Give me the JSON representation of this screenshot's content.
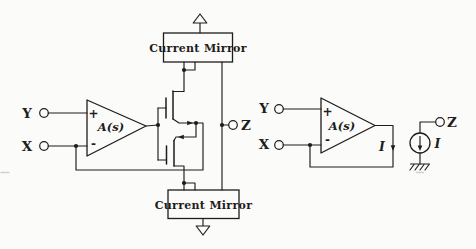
{
  "figure": {
    "colors": {
      "ink": "#1f1d1b",
      "paper": "#fbfbf9"
    },
    "left_circuit": {
      "terminal_y": "Y",
      "terminal_x": "X",
      "terminal_z": "Z",
      "opamp_gain_label": "A(s)",
      "opamp_plus": "+",
      "opamp_minus": "-",
      "top_current_mirror_label": "Current Mirror",
      "bottom_current_mirror_label": "Current Mirror"
    },
    "right_circuit": {
      "terminal_y": "Y",
      "terminal_x": "X",
      "terminal_z": "Z",
      "opamp_gain_label": "A(s)",
      "opamp_plus": "+",
      "opamp_minus": "-",
      "output_current_label": "I",
      "current_source_label": "I"
    }
  }
}
